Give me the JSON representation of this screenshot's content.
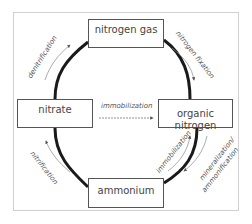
{
  "nodes": {
    "nitrogen_gas": "nitrogen gas",
    "nitrate": "nitrate",
    "organic_nitrogen": "organic nitrogen",
    "ammonium": "ammonium"
  },
  "processes": {
    "denitrification": "denitrification",
    "nitrogen_fixation": "nitrogen fixation",
    "immobilization_center": "immobilization",
    "nitrification": "nitrification",
    "immobilization_lower": "immobilization",
    "mineralization": "mineralization/",
    "ammonification": "ammonification"
  },
  "colors": {
    "cycle_line": "#1a1a1a",
    "arrow": "#777777",
    "box_border": "#555555",
    "frame": "#d0d0d0"
  }
}
